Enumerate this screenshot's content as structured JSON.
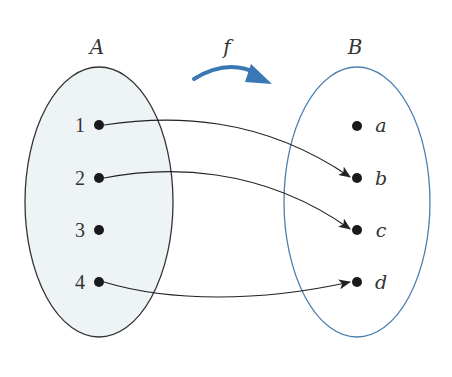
{
  "diagram": {
    "title_left": "A",
    "title_right": "B",
    "function_label": "f",
    "domain_set": {
      "name": "A",
      "elements": [
        "1",
        "2",
        "3",
        "4"
      ],
      "fill": "#eef3f6",
      "stroke": "#333333"
    },
    "codomain_set": {
      "name": "B",
      "elements": [
        "a",
        "b",
        "c",
        "d"
      ],
      "fill": "#ffffff",
      "stroke": "#4a7fb0"
    },
    "mappings": [
      {
        "from": "1",
        "to": "b"
      },
      {
        "from": "2",
        "to": "c"
      },
      {
        "from": "4",
        "to": "d"
      }
    ],
    "function_arrow_color": "#3a78b5"
  }
}
